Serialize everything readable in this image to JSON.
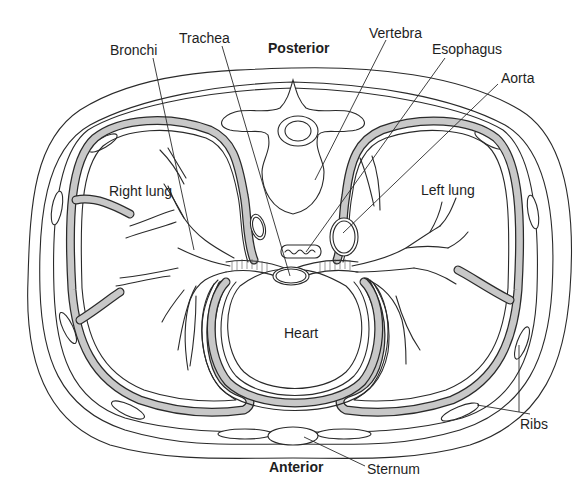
{
  "diagram": {
    "orientation": {
      "top": "Posterior",
      "bottom": "Anterior"
    },
    "labels": {
      "bronchi": "Bronchi",
      "trachea": "Trachea",
      "posterior": "Posterior",
      "vertebra": "Vertebra",
      "esophagus": "Esophagus",
      "aorta": "Aorta",
      "right_lung": "Right lung",
      "left_lung": "Left lung",
      "heart": "Heart",
      "ribs": "Ribs",
      "anterior": "Anterior",
      "sternum": "Sternum"
    },
    "colors": {
      "line": "#2a2a2a",
      "pleural_cavity": "#c8c8c8",
      "background": "#ffffff"
    }
  }
}
